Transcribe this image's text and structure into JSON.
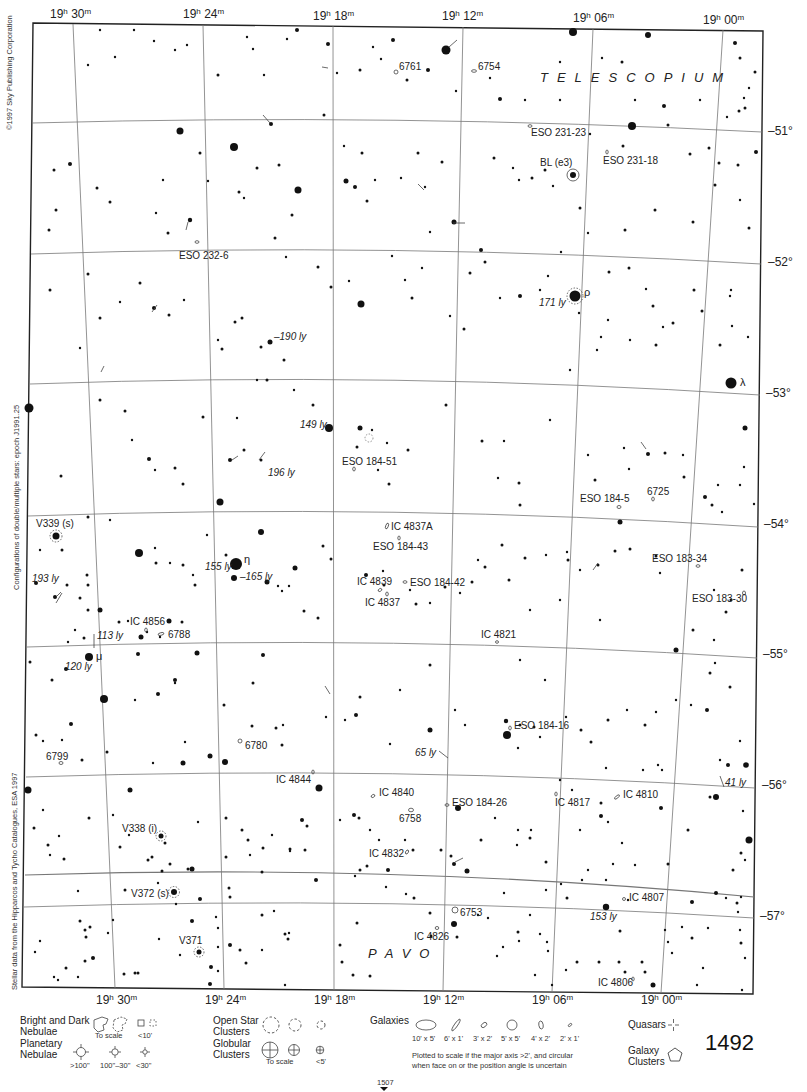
{
  "map": {
    "chart_number": "1492",
    "adjacent_chart_below": "1507",
    "constellations": [
      "TELESCOPIUM",
      "PAVO"
    ],
    "credits": {
      "copyright": "©1997 Sky Publishing Corporation",
      "double_stars": "Configurations of double/multiple stars: epoch J1991.25",
      "stellar_data": "Stellar data from the Hipparcos and Tycho Catalogues, ESA 1997"
    },
    "ra_labels_top": [
      {
        "h": "19",
        "m": "30"
      },
      {
        "h": "19",
        "m": "24"
      },
      {
        "h": "19",
        "m": "18"
      },
      {
        "h": "19",
        "m": "12"
      },
      {
        "h": "19",
        "m": "06"
      },
      {
        "h": "19",
        "m": "00"
      }
    ],
    "ra_labels_bottom": [
      {
        "h": "19",
        "m": "30"
      },
      {
        "h": "19",
        "m": "24"
      },
      {
        "h": "19",
        "m": "18"
      },
      {
        "h": "19",
        "m": "12"
      },
      {
        "h": "19",
        "m": "06"
      },
      {
        "h": "19",
        "m": "00"
      }
    ],
    "dec_labels": [
      "–51°",
      "–52°",
      "–53°",
      "–54°",
      "–55°",
      "–56°",
      "–57°"
    ],
    "star_names": {
      "rho": "ρ",
      "lambda": "λ",
      "eta": "η",
      "mu": "μ"
    },
    "variable_stars": [
      "BL (e3)",
      "V339 (s)",
      "V338 (i)",
      "V372 (s)",
      "V371"
    ],
    "distances": [
      "171 ly",
      "–190 ly",
      "149 ly",
      "196 ly",
      "155 ly",
      "–165 ly",
      "193 ly",
      "113 ly",
      "120 ly",
      "65 ly",
      "41 ly",
      "153 ly"
    ],
    "deep_sky_objects": [
      "6761",
      "6754",
      "ESO 231-23",
      "ESO 231-18",
      "ESO 232-6",
      "ESO 184-51",
      "ESO 184-5",
      "6725",
      "IC 4837A",
      "ESO 184-43",
      "IC 4839",
      "ESO 184-42",
      "IC 4837",
      "ESO 183-34",
      "ESO 183-30",
      "IC 4856",
      "6788",
      "IC 4821",
      "ESO 184-16",
      "6780",
      "6799",
      "IC 4844",
      "IC 4840",
      "6758",
      "ESO 184-26",
      "IC 4817",
      "IC 4810",
      "IC 4832",
      "IC 4807",
      "6753",
      "IC 4826",
      "IC 4806"
    ]
  },
  "legend": {
    "nebulae": {
      "title_line1": "Bright and Dark",
      "title_line2": "Nebulae",
      "to_scale": "To scale",
      "small": "<10'"
    },
    "planetary": {
      "title_line1": "Planetary",
      "title_line2": "Nebulae",
      "sizes": [
        ">100\"",
        "100\"–30\"",
        "<30\""
      ]
    },
    "open_clusters": {
      "title_line1": "Open Star",
      "title_line2": "Clusters"
    },
    "globular": {
      "title_line1": "Globular",
      "title_line2": "Clusters",
      "to_scale": "To scale",
      "small": "<5'"
    },
    "galaxies": {
      "title": "Galaxies",
      "sizes": [
        "10' x 5'",
        "6' x 1'",
        "3' x 2'",
        "5' x 5'",
        "4' x 2'",
        "2' x 1'"
      ],
      "note_line1": "Plotted to scale if the major axis >2', and circular",
      "note_line2": "when face on or the position angle is uncertain"
    },
    "quasars": {
      "title": "Quasars"
    },
    "galaxy_clusters": {
      "title_line1": "Galaxy",
      "title_line2": "Clusters"
    }
  }
}
